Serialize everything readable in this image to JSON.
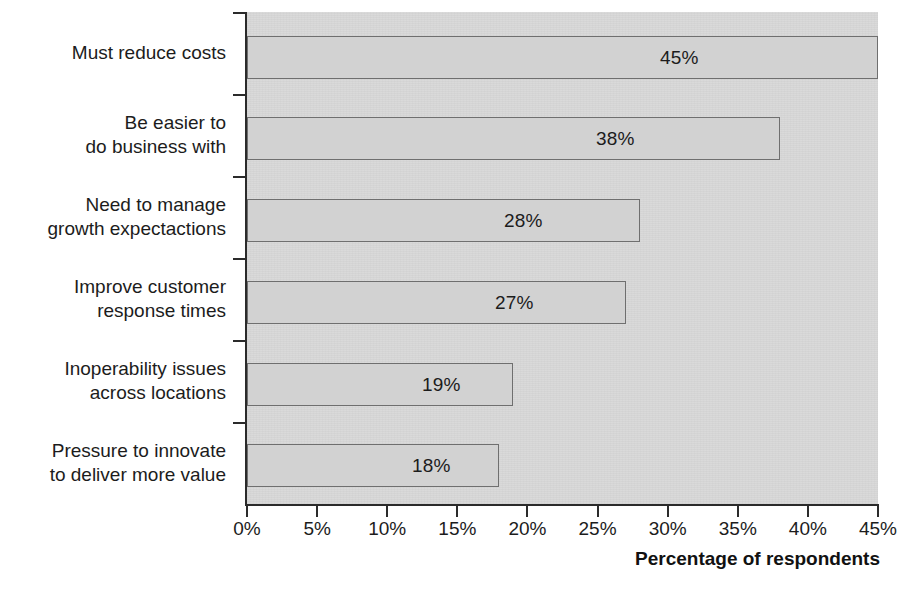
{
  "chart_data": {
    "type": "bar",
    "orientation": "horizontal",
    "title": "",
    "subtitle": "",
    "xlabel": "Percentage of respondents",
    "ylabel": "",
    "xlim": [
      0,
      45
    ],
    "grid": false,
    "legend": false,
    "categories": [
      "Must reduce costs",
      "Be easier to\ndo business with",
      "Need to manage\ngrowth expectactions",
      "Improve customer\nresponse times",
      "Inoperability issues\nacross locations",
      "Pressure to innovate\nto deliver more value"
    ],
    "values": [
      45,
      38,
      28,
      27,
      19,
      18
    ],
    "value_labels": [
      "45%",
      "38%",
      "28%",
      "27%",
      "19%",
      "18%"
    ],
    "x_tick_labels": [
      "0%",
      "5%",
      "10%",
      "15%",
      "20%",
      "25%",
      "30%",
      "35%",
      "40%",
      "45%"
    ],
    "x_tick_values": [
      0,
      5,
      10,
      15,
      20,
      25,
      30,
      35,
      40,
      45
    ],
    "colors": {
      "bar_fill": "#d2d2d2",
      "bar_border": "#6f6f6f",
      "plot_background": "#d9d9d9",
      "page_background": "#ffffff",
      "axis": "#2b2b2b",
      "text": "#1c1c1c"
    }
  }
}
